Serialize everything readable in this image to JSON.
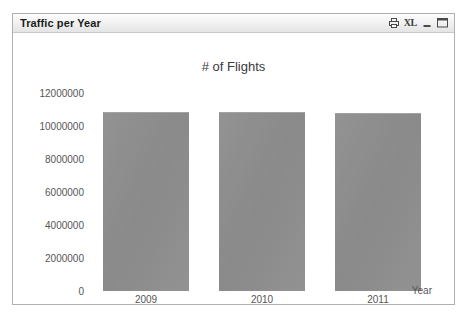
{
  "window": {
    "title": "Traffic per Year",
    "buttons": [
      {
        "name": "print-icon",
        "label": "",
        "icon": "print"
      },
      {
        "name": "export-excel-button",
        "label": "XL",
        "icon": "xl"
      },
      {
        "name": "minimize-button",
        "label": "",
        "icon": "minimize"
      },
      {
        "name": "maximize-button",
        "label": "",
        "icon": "maximize"
      }
    ]
  },
  "colors": {
    "bar_fill": "#8e8e8e",
    "bar_edge": "#a3a3a3",
    "window_border": "#b0b0b0",
    "titlebar_top": "#fdfdfd",
    "titlebar_bottom": "#e4e4e4",
    "text": "#555555",
    "title_text": "#3a3a3a",
    "plot_background": "#ffffff"
  },
  "chart_data": {
    "type": "bar",
    "title": "# of Flights",
    "xlabel": "Year",
    "ylabel": "",
    "categories": [
      "2009",
      "2010",
      "2011"
    ],
    "values": [
      10850000,
      10850000,
      10800000
    ],
    "ylim": [
      0,
      12000000
    ],
    "yticks": [
      0,
      2000000,
      4000000,
      6000000,
      8000000,
      10000000,
      12000000
    ],
    "ytick_labels": [
      "0",
      "2000000",
      "4000000",
      "6000000",
      "8000000",
      "10000000",
      "12000000"
    ],
    "grid": false,
    "legend": false
  }
}
